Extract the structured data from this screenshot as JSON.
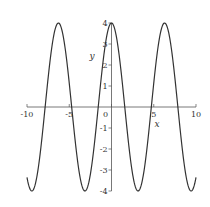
{
  "chart_data": {
    "type": "line",
    "title": "",
    "xlabel": "x",
    "ylabel": "y",
    "function": "y = 4cos(x)",
    "xlim": [
      -10,
      10
    ],
    "ylim": [
      -4,
      4
    ],
    "x_ticks": [
      -10,
      -5,
      0,
      5,
      10
    ],
    "x_tick_labels": [
      "-10",
      "-5",
      "0",
      "5",
      "10"
    ],
    "y_ticks": [
      -4,
      -3,
      -2,
      -1,
      1,
      2,
      3,
      4
    ],
    "y_tick_labels": [
      "-4",
      "-3",
      "-2",
      "-1",
      "1",
      "2",
      "3",
      "4"
    ],
    "grid": false,
    "legend": null,
    "series": [
      {
        "name": "4cos(x)",
        "color": "#333333",
        "x": [
          -10,
          -9.42,
          -8,
          -6.28,
          -5,
          -3.14,
          -2,
          0,
          2,
          3.14,
          5,
          6.28,
          8,
          9.42,
          10
        ],
        "y": [
          -3.36,
          -4,
          -0.58,
          4,
          1.13,
          -4,
          -1.66,
          4,
          -1.66,
          -4,
          1.13,
          4,
          -0.58,
          -4,
          -3.36
        ]
      }
    ],
    "peaks_x": [
      -6.28,
      0,
      6.28
    ],
    "troughs_x": [
      -9.42,
      -3.14,
      3.14,
      9.42
    ]
  },
  "colors": {
    "curve": "#333333",
    "axes": "#555555",
    "background": "#ffffff"
  }
}
